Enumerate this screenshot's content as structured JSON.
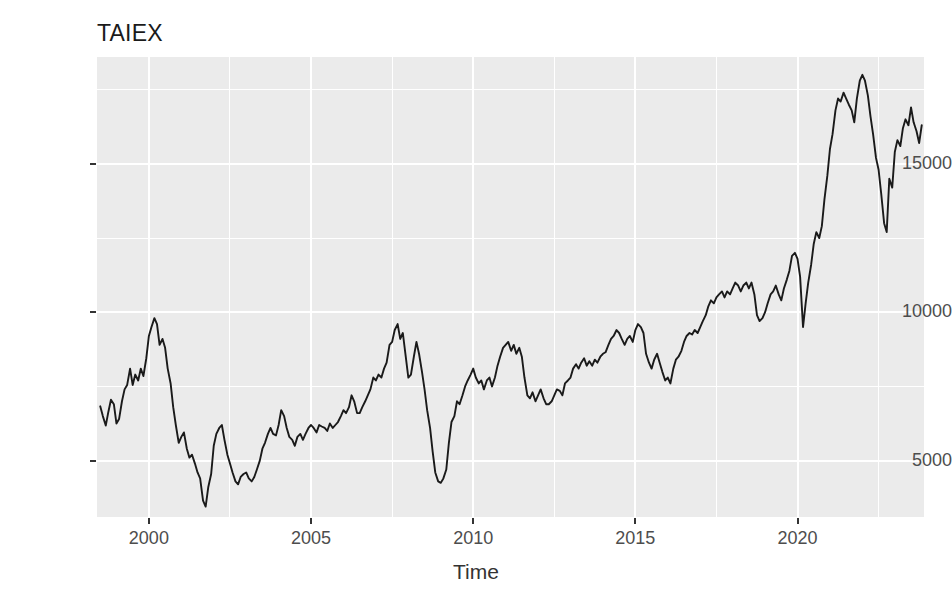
{
  "chart_data": {
    "type": "line",
    "title": "TAIEX",
    "xlabel": "Time",
    "ylabel": "",
    "xlim": [
      1998.4,
      2023.9
    ],
    "ylim": [
      3100,
      18600
    ],
    "grid": true,
    "legend": false,
    "legend_position": "none",
    "line_color": "#1a1a1a",
    "panel_background": "#ebebeb",
    "gridline_color": "#ffffff",
    "axis_text_color": "#4d4d4d",
    "x_ticks": [
      2000,
      2005,
      2010,
      2015,
      2020
    ],
    "x_tick_labels": [
      "2000",
      "2005",
      "2010",
      "2015",
      "2020"
    ],
    "x_minor_ticks": [
      1997.5,
      2002.5,
      2007.5,
      2012.5,
      2017.5,
      2022.5
    ],
    "y_ticks": [
      5000,
      10000,
      15000
    ],
    "y_tick_labels": [
      "5000",
      "10000",
      "15000"
    ],
    "y_minor_ticks": [
      2500,
      7500,
      12500,
      17500
    ],
    "series_name": "TAIEX",
    "x": [
      1998.5,
      1998.58,
      1998.67,
      1998.75,
      1998.83,
      1998.92,
      1999.0,
      1999.08,
      1999.17,
      1999.25,
      1999.33,
      1999.42,
      1999.5,
      1999.58,
      1999.67,
      1999.75,
      1999.83,
      1999.92,
      2000.0,
      2000.08,
      2000.17,
      2000.25,
      2000.33,
      2000.42,
      2000.5,
      2000.58,
      2000.67,
      2000.75,
      2000.83,
      2000.92,
      2001.0,
      2001.08,
      2001.17,
      2001.25,
      2001.33,
      2001.42,
      2001.5,
      2001.58,
      2001.67,
      2001.75,
      2001.83,
      2001.92,
      2002.0,
      2002.08,
      2002.17,
      2002.25,
      2002.33,
      2002.42,
      2002.5,
      2002.58,
      2002.67,
      2002.75,
      2002.83,
      2002.92,
      2003.0,
      2003.08,
      2003.17,
      2003.25,
      2003.33,
      2003.42,
      2003.5,
      2003.58,
      2003.67,
      2003.75,
      2003.83,
      2003.92,
      2004.0,
      2004.08,
      2004.17,
      2004.25,
      2004.33,
      2004.42,
      2004.5,
      2004.58,
      2004.67,
      2004.75,
      2004.83,
      2004.92,
      2005.0,
      2005.08,
      2005.17,
      2005.25,
      2005.33,
      2005.42,
      2005.5,
      2005.58,
      2005.67,
      2005.75,
      2005.83,
      2005.92,
      2006.0,
      2006.08,
      2006.17,
      2006.25,
      2006.33,
      2006.42,
      2006.5,
      2006.58,
      2006.67,
      2006.75,
      2006.83,
      2006.92,
      2007.0,
      2007.08,
      2007.17,
      2007.25,
      2007.33,
      2007.42,
      2007.5,
      2007.58,
      2007.67,
      2007.75,
      2007.83,
      2007.92,
      2008.0,
      2008.08,
      2008.17,
      2008.25,
      2008.33,
      2008.42,
      2008.5,
      2008.58,
      2008.67,
      2008.75,
      2008.83,
      2008.92,
      2009.0,
      2009.08,
      2009.17,
      2009.25,
      2009.33,
      2009.42,
      2009.5,
      2009.58,
      2009.67,
      2009.75,
      2009.83,
      2009.92,
      2010.0,
      2010.08,
      2010.17,
      2010.25,
      2010.33,
      2010.42,
      2010.5,
      2010.58,
      2010.67,
      2010.75,
      2010.83,
      2010.92,
      2011.0,
      2011.08,
      2011.17,
      2011.25,
      2011.33,
      2011.42,
      2011.5,
      2011.58,
      2011.67,
      2011.75,
      2011.83,
      2011.92,
      2012.0,
      2012.08,
      2012.17,
      2012.25,
      2012.33,
      2012.42,
      2012.5,
      2012.58,
      2012.67,
      2012.75,
      2012.83,
      2012.92,
      2013.0,
      2013.08,
      2013.17,
      2013.25,
      2013.33,
      2013.42,
      2013.5,
      2013.58,
      2013.67,
      2013.75,
      2013.83,
      2013.92,
      2014.0,
      2014.08,
      2014.17,
      2014.25,
      2014.33,
      2014.42,
      2014.5,
      2014.58,
      2014.67,
      2014.75,
      2014.83,
      2014.92,
      2015.0,
      2015.08,
      2015.17,
      2015.25,
      2015.33,
      2015.42,
      2015.5,
      2015.58,
      2015.67,
      2015.75,
      2015.83,
      2015.92,
      2016.0,
      2016.08,
      2016.17,
      2016.25,
      2016.33,
      2016.42,
      2016.5,
      2016.58,
      2016.67,
      2016.75,
      2016.83,
      2016.92,
      2017.0,
      2017.08,
      2017.17,
      2017.25,
      2017.33,
      2017.42,
      2017.5,
      2017.58,
      2017.67,
      2017.75,
      2017.83,
      2017.92,
      2018.0,
      2018.08,
      2018.17,
      2018.25,
      2018.33,
      2018.42,
      2018.5,
      2018.58,
      2018.67,
      2018.75,
      2018.83,
      2018.92,
      2019.0,
      2019.08,
      2019.17,
      2019.25,
      2019.33,
      2019.42,
      2019.5,
      2019.58,
      2019.67,
      2019.75,
      2019.83,
      2019.92,
      2020.0,
      2020.08,
      2020.17,
      2020.25,
      2020.33,
      2020.42,
      2020.5,
      2020.58,
      2020.67,
      2020.75,
      2020.83,
      2020.92,
      2021.0,
      2021.08,
      2021.17,
      2021.25,
      2021.33,
      2021.42,
      2021.5,
      2021.58,
      2021.67,
      2021.75,
      2021.83,
      2021.92,
      2022.0,
      2022.08,
      2022.17,
      2022.25,
      2022.33,
      2022.42,
      2022.5,
      2022.58,
      2022.67,
      2022.75,
      2022.83,
      2022.92,
      2023.0,
      2023.08,
      2023.17,
      2023.25,
      2023.33,
      2023.42,
      2023.5,
      2023.58,
      2023.67,
      2023.75,
      2023.83
    ],
    "values": [
      6830,
      6500,
      6180,
      6640,
      7050,
      6900,
      6250,
      6400,
      7000,
      7400,
      7550,
      8100,
      7550,
      7900,
      7700,
      8100,
      7850,
      8450,
      9200,
      9500,
      9800,
      9600,
      8900,
      9100,
      8800,
      8100,
      7600,
      6800,
      6200,
      5600,
      5800,
      5950,
      5400,
      5100,
      5200,
      4900,
      4600,
      4400,
      3650,
      3450,
      4100,
      4550,
      5500,
      5900,
      6100,
      6200,
      5700,
      5200,
      4900,
      4600,
      4300,
      4200,
      4450,
      4550,
      4600,
      4400,
      4300,
      4450,
      4700,
      5000,
      5400,
      5600,
      5900,
      6100,
      5900,
      5850,
      6200,
      6700,
      6500,
      6100,
      5800,
      5700,
      5500,
      5800,
      5900,
      5700,
      5900,
      6100,
      6200,
      6100,
      5950,
      6200,
      6150,
      6100,
      6000,
      6250,
      6100,
      6200,
      6300,
      6500,
      6700,
      6600,
      6800,
      7200,
      7000,
      6600,
      6600,
      6800,
      7000,
      7200,
      7400,
      7800,
      7700,
      7900,
      7800,
      8100,
      8300,
      8900,
      9000,
      9400,
      9600,
      9100,
      9300,
      8500,
      7800,
      7900,
      8500,
      9000,
      8600,
      8000,
      7400,
      6700,
      6100,
      5300,
      4600,
      4300,
      4250,
      4400,
      4700,
      5600,
      6300,
      6500,
      7000,
      6900,
      7200,
      7500,
      7700,
      7900,
      8100,
      7800,
      7600,
      7700,
      7400,
      7700,
      7800,
      7500,
      7800,
      8200,
      8500,
      8800,
      8900,
      9000,
      8700,
      8900,
      8600,
      8800,
      8500,
      7800,
      7200,
      7100,
      7300,
      7000,
      7200,
      7400,
      7100,
      6900,
      6900,
      7000,
      7200,
      7400,
      7350,
      7200,
      7600,
      7700,
      7800,
      8100,
      8250,
      8100,
      8300,
      8450,
      8200,
      8350,
      8200,
      8400,
      8300,
      8500,
      8600,
      8650,
      8900,
      9100,
      9200,
      9400,
      9300,
      9100,
      8900,
      9100,
      9200,
      9000,
      9400,
      9600,
      9500,
      9300,
      8600,
      8300,
      8100,
      8400,
      8600,
      8300,
      8000,
      7700,
      7800,
      7600,
      8100,
      8400,
      8500,
      8700,
      9000,
      9200,
      9300,
      9250,
      9400,
      9300,
      9500,
      9700,
      9900,
      10200,
      10400,
      10300,
      10500,
      10600,
      10700,
      10500,
      10700,
      10600,
      10800,
      11000,
      10900,
      10700,
      10900,
      11000,
      10800,
      11000,
      10600,
      9900,
      9700,
      9800,
      10000,
      10300,
      10600,
      10700,
      10900,
      10600,
      10400,
      10800,
      11100,
      11400,
      11900,
      12000,
      11800,
      11200,
      9500,
      10300,
      11000,
      11600,
      12300,
      12700,
      12500,
      12900,
      13800,
      14600,
      15500,
      16000,
      16800,
      17200,
      17100,
      17400,
      17200,
      17000,
      16800,
      16400,
      17200,
      17800,
      18000,
      17800,
      17300,
      16600,
      16000,
      15200,
      14800,
      14000,
      13000,
      12700,
      14500,
      14200,
      15400,
      15800,
      15600,
      16200,
      16500,
      16300,
      16900,
      16400,
      16100,
      15700,
      16300
    ]
  }
}
